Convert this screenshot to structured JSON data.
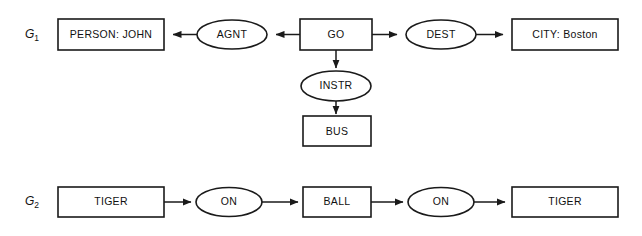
{
  "figure": {
    "type": "conceptual-graph-diagram",
    "background_color": "#ffffff",
    "line_color": "#1a1a1a",
    "text_color": "#111111"
  },
  "graphs": [
    {
      "id": "g1",
      "label_base": "G",
      "label_sub": "1",
      "concepts": [
        {
          "id": "person-john",
          "text": "PERSON: JOHN",
          "shape": "box"
        },
        {
          "id": "go",
          "text": "GO",
          "shape": "box"
        },
        {
          "id": "city-boston",
          "text": "CITY: Boston",
          "shape": "box"
        },
        {
          "id": "bus",
          "text": "BUS",
          "shape": "box"
        }
      ],
      "relations": [
        {
          "id": "agnt",
          "text": "AGNT",
          "shape": "ellipse"
        },
        {
          "id": "dest",
          "text": "DEST",
          "shape": "ellipse"
        },
        {
          "id": "instr",
          "text": "INSTR",
          "shape": "ellipse"
        }
      ],
      "edges": [
        {
          "from": "go",
          "to": "agnt",
          "direction": "left"
        },
        {
          "from": "agnt",
          "to": "person-john",
          "direction": "left"
        },
        {
          "from": "go",
          "to": "dest",
          "direction": "right"
        },
        {
          "from": "dest",
          "to": "city-boston",
          "direction": "right"
        },
        {
          "from": "go",
          "to": "instr",
          "direction": "down"
        },
        {
          "from": "instr",
          "to": "bus",
          "direction": "down"
        }
      ]
    },
    {
      "id": "g2",
      "label_base": "G",
      "label_sub": "2",
      "concepts": [
        {
          "id": "tiger-left",
          "text": "TIGER",
          "shape": "box"
        },
        {
          "id": "ball",
          "text": "BALL",
          "shape": "box"
        },
        {
          "id": "tiger-right",
          "text": "TIGER",
          "shape": "box"
        }
      ],
      "relations": [
        {
          "id": "on-left",
          "text": "ON",
          "shape": "ellipse"
        },
        {
          "id": "on-right",
          "text": "ON",
          "shape": "ellipse"
        }
      ],
      "edges": [
        {
          "from": "tiger-left",
          "to": "on-left",
          "direction": "right"
        },
        {
          "from": "on-left",
          "to": "ball",
          "direction": "right"
        },
        {
          "from": "ball",
          "to": "on-right",
          "direction": "right"
        },
        {
          "from": "on-right",
          "to": "tiger-right",
          "direction": "right"
        }
      ]
    }
  ]
}
